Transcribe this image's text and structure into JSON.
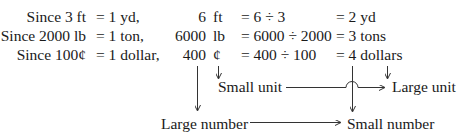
{
  "header_fragment": "Example",
  "rows": [
    {
      "premise": "Since 3 ft",
      "equiv": "= 1 yd,",
      "number": "6",
      "unit": "ft",
      "calc": "= 6 ÷ 3",
      "result": "= 2 yd"
    },
    {
      "premise": "Since 2000 lb",
      "equiv": "= 1 ton,",
      "number": "6000",
      "unit": "lb",
      "calc": "= 6000 ÷ 2000",
      "result": "= 3 tons"
    },
    {
      "premise": "Since 100¢",
      "equiv": "= 1 dollar,",
      "number": "400",
      "unit": "¢",
      "calc": "= 400 ÷ 100",
      "result": "= 4 dollars"
    }
  ],
  "annotations": {
    "small_unit": "Small unit",
    "large_unit": "Large unit",
    "large_number": "Large number",
    "small_number": "Small number"
  }
}
